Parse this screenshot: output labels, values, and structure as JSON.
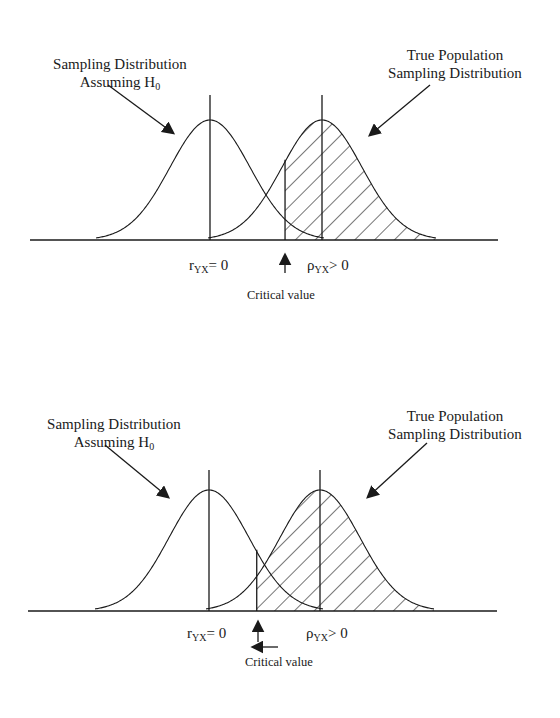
{
  "figure_title": "",
  "panels": [
    {
      "id": "top",
      "null_label_line1": "Sampling Distribution",
      "null_label_line2": "Assuming H",
      "null_label_sub": "0",
      "true_label_line1": "True Population",
      "true_label_line2": "Sampling Distribution",
      "null_mean_label": "r",
      "null_mean_sub": "YX",
      "null_mean_rel": "= 0",
      "true_mean_label": "ρ",
      "true_mean_sub": "YX",
      "true_mean_rel": "> 0",
      "critical_label": "Critical value",
      "null_mean": 0,
      "true_mean": 1.0,
      "critical_value": 0.67,
      "shading": "power region (right of critical value under true distribution)",
      "extra_left_arrow": false
    },
    {
      "id": "bottom",
      "null_label_line1": "Sampling Distribution",
      "null_label_line2": "Assuming H",
      "null_label_sub": "0",
      "true_label_line1": "True Population",
      "true_label_line2": "Sampling Distribution",
      "null_mean_label": "r",
      "null_mean_sub": "YX",
      "null_mean_rel": "= 0",
      "true_mean_label": "ρ",
      "true_mean_sub": "YX",
      "true_mean_rel": "> 0",
      "critical_label": "Critical value",
      "null_mean": 0,
      "true_mean": 1.0,
      "critical_value": 0.43,
      "shading": "power region (right of critical value under true distribution)",
      "extra_left_arrow": true
    }
  ],
  "colors": {
    "ink": "#1a1a1a",
    "background": "#ffffff"
  }
}
